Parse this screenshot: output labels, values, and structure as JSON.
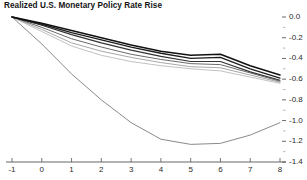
{
  "chart_data": {
    "type": "line",
    "title": "Realized U.S. Monetary Policy Rate Rise",
    "xlabel": "",
    "ylabel": "",
    "xlim": [
      -1,
      8
    ],
    "ylim": [
      -1.4,
      0.0
    ],
    "grid": false,
    "legend": "none",
    "x": [
      -1,
      0,
      1,
      2,
      3,
      4,
      5,
      6,
      7,
      8
    ],
    "xticks": [
      "-1",
      "0",
      "1",
      "2",
      "3",
      "4",
      "5",
      "6",
      "7",
      "8"
    ],
    "yticks": [
      "0.0",
      "-0.2",
      "-0.4",
      "-0.6",
      "-0.8",
      "-1.0",
      "-1.2",
      "-1.4"
    ],
    "ytick_values": [
      0.0,
      -0.2,
      -0.4,
      -0.6,
      -0.8,
      -1.0,
      -1.2,
      -1.4
    ],
    "series": [
      {
        "name": "series-1-dark",
        "color": "#111111",
        "width": 1.5,
        "values": [
          0.0,
          -0.06,
          -0.13,
          -0.2,
          -0.27,
          -0.33,
          -0.37,
          -0.36,
          -0.47,
          -0.56
        ]
      },
      {
        "name": "series-2-dark",
        "color": "#1d1d1d",
        "width": 1.3,
        "values": [
          0.0,
          -0.07,
          -0.15,
          -0.22,
          -0.29,
          -0.35,
          -0.4,
          -0.39,
          -0.5,
          -0.59
        ]
      },
      {
        "name": "series-3-dark",
        "color": "#333333",
        "width": 1.1,
        "values": [
          0.0,
          -0.08,
          -0.17,
          -0.25,
          -0.32,
          -0.38,
          -0.43,
          -0.43,
          -0.53,
          -0.61
        ]
      },
      {
        "name": "series-4-mid",
        "color": "#6b6b6b",
        "width": 1.0,
        "values": [
          0.0,
          -0.1,
          -0.21,
          -0.29,
          -0.36,
          -0.41,
          -0.45,
          -0.46,
          -0.54,
          -0.62
        ]
      },
      {
        "name": "series-5-light",
        "color": "#a8a8a8",
        "width": 1.0,
        "values": [
          0.0,
          -0.12,
          -0.25,
          -0.33,
          -0.39,
          -0.44,
          -0.48,
          -0.49,
          -0.56,
          -0.63
        ]
      },
      {
        "name": "series-6-light",
        "color": "#c2c2c2",
        "width": 1.0,
        "values": [
          0.0,
          -0.14,
          -0.28,
          -0.37,
          -0.43,
          -0.47,
          -0.5,
          -0.52,
          -0.58,
          -0.64
        ]
      },
      {
        "name": "series-7-outlier",
        "color": "#8a8a8a",
        "width": 1.0,
        "values": [
          0.0,
          -0.26,
          -0.55,
          -0.8,
          -1.02,
          -1.18,
          -1.23,
          -1.22,
          -1.14,
          -1.02
        ]
      }
    ]
  }
}
